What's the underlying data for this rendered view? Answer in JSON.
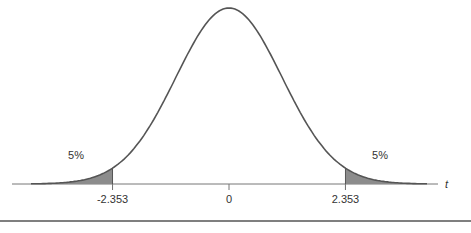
{
  "chart_data": {
    "type": "area",
    "title": "",
    "distribution": "t",
    "xlabel": "t",
    "ylabel": "",
    "xlim": [
      -4.0,
      4.0
    ],
    "critical_values": [
      -2.353,
      2.353
    ],
    "tick_labels": [
      "-2.353",
      "0",
      "2.353"
    ],
    "ticks": [
      -2.353,
      0,
      2.353
    ],
    "shaded_regions": [
      {
        "name": "left-tail",
        "from": -4.0,
        "to": -2.353,
        "area_label": "5%"
      },
      {
        "name": "right-tail",
        "from": 2.353,
        "to": 4.0,
        "area_label": "5%"
      }
    ],
    "annotations": [
      "5%",
      "5%"
    ],
    "colors": {
      "curve": "#555555",
      "shade": "#8c8c8c",
      "axis": "#777777"
    }
  }
}
